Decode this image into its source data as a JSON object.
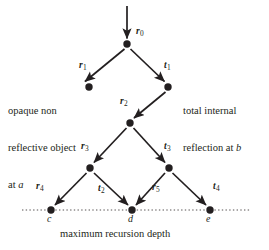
{
  "figure": {
    "background_color": "#ffffff",
    "ink_color": "#231f20",
    "width": 269,
    "height": 250
  },
  "annotations": {
    "left_text_line1": "opaque non",
    "left_text_line2": "reflective object",
    "left_text_line3_prefix": "at ",
    "left_text_line3_italic": "a",
    "right_text_line1": "total internal",
    "right_text_line2_prefix": "reflection at ",
    "right_text_line2_italic": "b",
    "caption": "maximum recursion depth"
  },
  "ray_labels": [
    {
      "id": "r0",
      "base": "r",
      "sub": "0",
      "x": 136,
      "y": 34
    },
    {
      "id": "r1",
      "base": "r",
      "sub": "1",
      "x": 79,
      "y": 68
    },
    {
      "id": "t1",
      "base": "t",
      "sub": "1",
      "x": 164,
      "y": 68
    },
    {
      "id": "r2",
      "base": "r",
      "sub": "2",
      "x": 120,
      "y": 104
    },
    {
      "id": "r3",
      "base": "r",
      "sub": "3",
      "x": 81,
      "y": 149
    },
    {
      "id": "t3",
      "base": "t",
      "sub": "3",
      "x": 164,
      "y": 149
    },
    {
      "id": "r4",
      "base": "r",
      "sub": "4",
      "x": 37,
      "y": 189
    },
    {
      "id": "t2",
      "base": "t",
      "sub": "2",
      "x": 99,
      "y": 191
    },
    {
      "id": "r5",
      "base": "r",
      "sub": "5",
      "x": 153,
      "y": 190
    },
    {
      "id": "t4",
      "base": "t",
      "sub": "4",
      "x": 214,
      "y": 189
    }
  ],
  "point_labels": [
    {
      "id": "c",
      "text": "c",
      "x": 48,
      "y": 214
    },
    {
      "id": "d",
      "text": "d",
      "x": 129,
      "y": 214
    },
    {
      "id": "e",
      "text": "e",
      "x": 207,
      "y": 214
    }
  ],
  "nodes": [
    {
      "id": "r0",
      "x": 127,
      "y": 44,
      "r": 3.6
    },
    {
      "id": "r1",
      "x": 89,
      "y": 87,
      "r": 3.6
    },
    {
      "id": "t1",
      "x": 168,
      "y": 87,
      "r": 3.6
    },
    {
      "id": "r2",
      "x": 130,
      "y": 123,
      "r": 3.6
    },
    {
      "id": "r3",
      "x": 90,
      "y": 168,
      "r": 3.6
    },
    {
      "id": "t3",
      "x": 169,
      "y": 168,
      "r": 3.6
    },
    {
      "id": "c",
      "x": 51,
      "y": 210,
      "r": 3.6
    },
    {
      "id": "d",
      "x": 132,
      "y": 210,
      "r": 3.6
    },
    {
      "id": "e",
      "x": 210,
      "y": 210,
      "r": 3.6
    }
  ],
  "edges": [
    {
      "id": "incident-ray",
      "from": "top",
      "to": "r0",
      "x1": 127,
      "y1": 6,
      "x2": 127,
      "y2": 38
    },
    {
      "id": "r0-to-r1",
      "from": "r0",
      "to": "r1",
      "x1": 131,
      "y1": 49,
      "x2": 85,
      "y2": 82
    },
    {
      "id": "r0-to-t1",
      "from": "r0",
      "to": "t1",
      "x1": 132,
      "y1": 49,
      "x2": 164,
      "y2": 82
    },
    {
      "id": "t1-to-r2",
      "from": "t1",
      "to": "r2",
      "x1": 164,
      "y1": 92,
      "x2": 134,
      "y2": 118
    },
    {
      "id": "r2-to-r3",
      "from": "r2",
      "to": "r3",
      "x1": 126,
      "y1": 128,
      "x2": 94,
      "y2": 163
    },
    {
      "id": "r2-to-t3",
      "from": "r2",
      "to": "t3",
      "x1": 134,
      "y1": 128,
      "x2": 165,
      "y2": 163
    },
    {
      "id": "r3-to-c",
      "from": "r3",
      "to": "c",
      "x1": 86,
      "y1": 173,
      "x2": 55,
      "y2": 205
    },
    {
      "id": "r3-to-d",
      "from": "r3",
      "to": "d",
      "x1": 94,
      "y1": 173,
      "x2": 128,
      "y2": 205
    },
    {
      "id": "t3-to-d",
      "from": "t3",
      "to": "d",
      "x1": 165,
      "y1": 173,
      "x2": 136,
      "y2": 205
    },
    {
      "id": "t3-to-e",
      "from": "t3",
      "to": "e",
      "x1": 173,
      "y1": 173,
      "x2": 206,
      "y2": 205
    }
  ],
  "depth_line": {
    "id": "max-depth-line",
    "x1": 22,
    "x2": 250,
    "y": 210,
    "style": "dotted"
  }
}
